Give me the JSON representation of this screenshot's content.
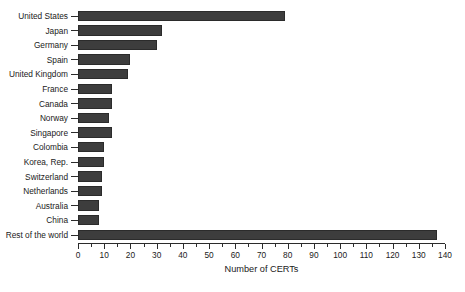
{
  "chart_data": {
    "type": "bar",
    "orientation": "horizontal",
    "title": "",
    "xlabel": "Number of CERTs",
    "ylabel": "",
    "xlim": [
      0,
      140
    ],
    "ylim": null,
    "grid": false,
    "legend": null,
    "x_major_ticks": [
      0,
      10,
      20,
      30,
      40,
      50,
      60,
      70,
      80,
      90,
      100,
      110,
      120,
      130,
      140
    ],
    "x_minor_ticks": [
      5,
      15,
      25,
      35,
      45,
      55,
      65,
      75,
      85,
      95,
      105,
      115,
      125,
      135
    ],
    "x_tick_labels": [
      "0",
      "10",
      "20",
      "30",
      "40",
      "50",
      "60",
      "70",
      "80",
      "90",
      "100",
      "110",
      "120",
      "130",
      "140"
    ],
    "bar_color": "#3d3d3d",
    "bar_edge_color": "#2b2b2b",
    "background_color": "#ffffff",
    "categories": [
      "United States",
      "Japan",
      "Germany",
      "Spain",
      "United Kingdom",
      "France",
      "Canada",
      "Norway",
      "Singapore",
      "Colombia",
      "Korea, Rep.",
      "Switzerland",
      "Netherlands",
      "Australia",
      "China",
      "Rest of the world"
    ],
    "values": [
      79,
      32,
      30,
      20,
      19,
      13,
      13,
      12,
      13,
      10,
      10,
      9,
      9,
      8,
      8,
      137
    ]
  }
}
